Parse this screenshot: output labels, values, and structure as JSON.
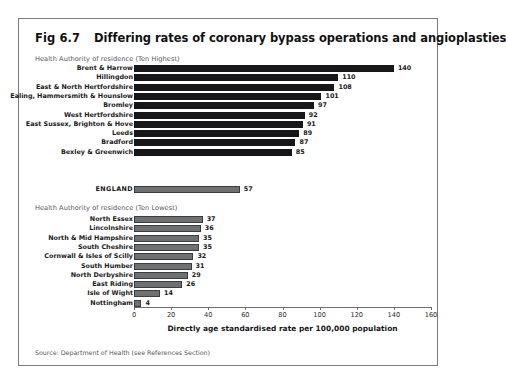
{
  "figure": {
    "number": "Fig 6.7",
    "title": "Differing rates of coronary bypass operations and angioplasties",
    "source": "Source: Department of Health (see References Section)"
  },
  "captions": {
    "highest": "Health Authority of residence (Ten Highest)",
    "lowest": "Health Authority of residence (Ten Lowest)"
  },
  "chart_data": {
    "type": "bar",
    "orientation": "horizontal",
    "title": "Differing rates of coronary bypass operations and angioplasties",
    "xlabel": "Directly age standardised rate per 100,000 population",
    "ylabel": "",
    "xlim": [
      0,
      160
    ],
    "xticks": [
      0,
      20,
      40,
      60,
      80,
      100,
      120,
      140,
      160
    ],
    "grid": false,
    "legend": false,
    "groups": [
      {
        "name": "Health Authority of residence (Ten Highest)",
        "color": "#17171a",
        "categories": [
          "Brent & Harrow",
          "Hillingdon",
          "East & North Hertfordshire",
          "Ealing, Hammersmith & Hounslow",
          "Bromley",
          "West Hertfordshire",
          "East Sussex, Brighton & Hove",
          "Leeds",
          "Bradford",
          "Bexley & Greenwich"
        ],
        "values": [
          140,
          110,
          108,
          101,
          97,
          92,
          91,
          89,
          87,
          85
        ]
      },
      {
        "name": "ENGLAND",
        "color": "#6e7072",
        "categories": [
          "ENGLAND"
        ],
        "values": [
          57
        ]
      },
      {
        "name": "Health Authority of residence (Ten Lowest)",
        "color": "#6e7072",
        "categories": [
          "North Essex",
          "Lincolnshire",
          "North & Mid Hampshire",
          "South Cheshire",
          "Cornwall & Isles of Scilly",
          "South Humber",
          "North Derbyshire",
          "East Riding",
          "Isle of Wight",
          "Nottingham"
        ],
        "values": [
          37,
          36,
          35,
          35,
          32,
          31,
          29,
          26,
          14,
          4
        ]
      }
    ]
  },
  "colors": {
    "bar_dark": "#17171a",
    "bar_gray": "#6e7072",
    "frame_border": "#7a7a7a",
    "axis": "#6d6e70"
  }
}
